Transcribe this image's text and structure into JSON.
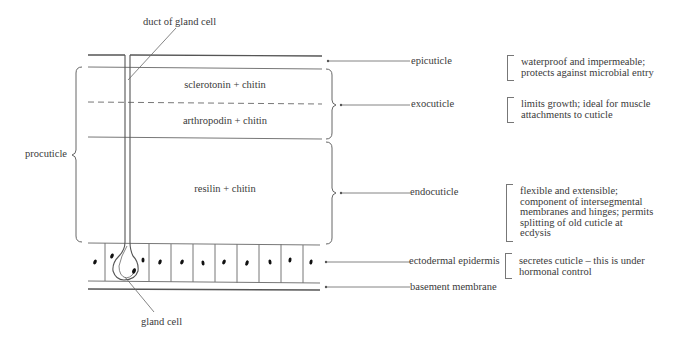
{
  "diagram": {
    "title_labels": {
      "duct": "duct of gland cell",
      "gland_cell": "gland cell",
      "procuticle": "procuticle"
    },
    "layer_contents": {
      "exo_upper": "sclerotonin + chitin",
      "exo_lower": "arthropodin + chitin",
      "endo": "resilin + chitin"
    },
    "layers": [
      {
        "name": "epicuticle",
        "description": [
          "waterproof and impermeable;",
          "protects against microbial entry"
        ]
      },
      {
        "name": "exocuticle",
        "description": [
          "limits growth; ideal for muscle",
          "attachments to cuticle"
        ]
      },
      {
        "name": "endocuticle",
        "description": [
          "flexible and extensible;",
          "component of intersegmental",
          "membranes and hinges; permits",
          "splitting of old cuticle at",
          "ecdysis"
        ]
      },
      {
        "name": "ectodermal epidermis",
        "description": [
          "secretes cuticle – this is under",
          "hormonal control"
        ]
      },
      {
        "name": "basement membrane",
        "description": []
      }
    ],
    "colors": {
      "line": "#555555",
      "text": "#3a3a3a",
      "nucleus": "#111111"
    }
  }
}
